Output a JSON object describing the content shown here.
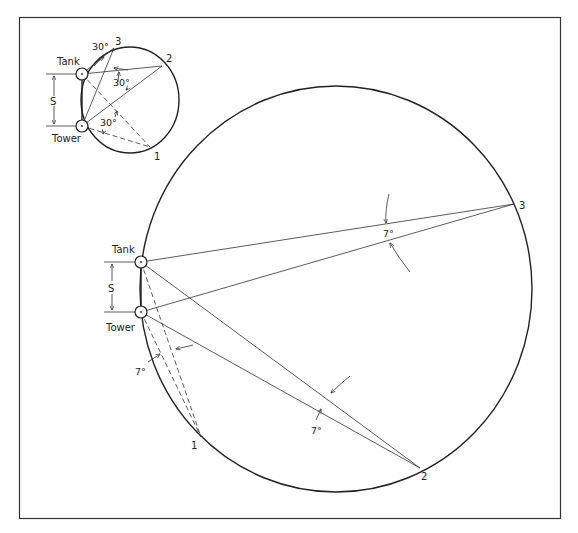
{
  "inset": {
    "labels": {
      "tank": "Tank",
      "tower": "Tower",
      "separation": "S",
      "point1": "1",
      "point2": "2",
      "point3": "3",
      "angle_a": "30°",
      "angle_b": "30°",
      "angle_c": "30°"
    }
  },
  "main": {
    "labels": {
      "tank": "Tank",
      "tower": "Tower",
      "separation": "S",
      "point1": "1",
      "point2": "2",
      "point3": "3",
      "angle_1": "7°",
      "angle_2": "7°",
      "angle_3": "7°"
    }
  },
  "colors": {
    "line": "#333333",
    "background": "#ffffff"
  }
}
